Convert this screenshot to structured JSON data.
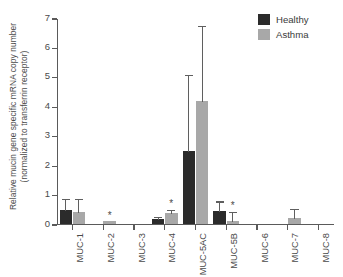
{
  "chart_data": {
    "type": "bar",
    "title": "",
    "xlabel": "",
    "ylabel_line1": "Relative mucin gene specific mRNA copy number",
    "ylabel_line2": "(normalized to transferrin receptor)",
    "ylim": [
      0,
      7
    ],
    "yticks": [
      0,
      1,
      2,
      3,
      4,
      5,
      6,
      7
    ],
    "ytick_labels": [
      "0",
      "1",
      "2",
      "3",
      "4",
      "5",
      "6",
      "7"
    ],
    "grid": false,
    "legend_position": "top-right",
    "categories": [
      "MUC-1",
      "MUC-2",
      "MUC-3",
      "MUC-4",
      "MUC-5AC",
      "MUC-5B",
      "MUC-6",
      "MUC-7",
      "MUC-8"
    ],
    "series": [
      {
        "name": "Healthy",
        "color": "#2b2b2b",
        "values": [
          0.48,
          0,
          0,
          0.17,
          2.48,
          0.43,
          0,
          0,
          0
        ],
        "errors": [
          0.42,
          0,
          0,
          0.09,
          2.62,
          0.37,
          0,
          0,
          0
        ],
        "significance": [
          "",
          "",
          "",
          "",
          "",
          "",
          "",
          "",
          ""
        ]
      },
      {
        "name": "Asthma",
        "color": "#a8a8a8",
        "values": [
          0.42,
          0.1,
          0,
          0.38,
          4.18,
          0.1,
          0,
          0.22,
          0
        ],
        "errors": [
          0.48,
          0,
          0,
          0.12,
          2.57,
          0.33,
          0,
          0.33,
          0
        ],
        "significance": [
          "",
          "*",
          "",
          "*",
          "",
          "*",
          "",
          "",
          ""
        ]
      }
    ]
  },
  "legend": {
    "items": [
      {
        "label": "Healthy",
        "color": "#2b2b2b"
      },
      {
        "label": "Asthma",
        "color": "#a8a8a8"
      }
    ]
  }
}
